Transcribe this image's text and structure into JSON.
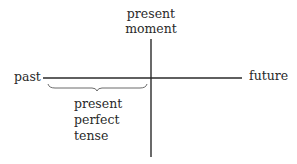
{
  "diagram": {
    "title": "",
    "labels": {
      "present_moment_line1": "present",
      "present_moment_line2": "moment",
      "past": "past",
      "future": "future",
      "ppt_line1": "present",
      "ppt_line2": "perfect",
      "ppt_line3": "tense"
    },
    "colors": {
      "line": "#2a2a2a",
      "brace": "#6a6a6a"
    }
  }
}
